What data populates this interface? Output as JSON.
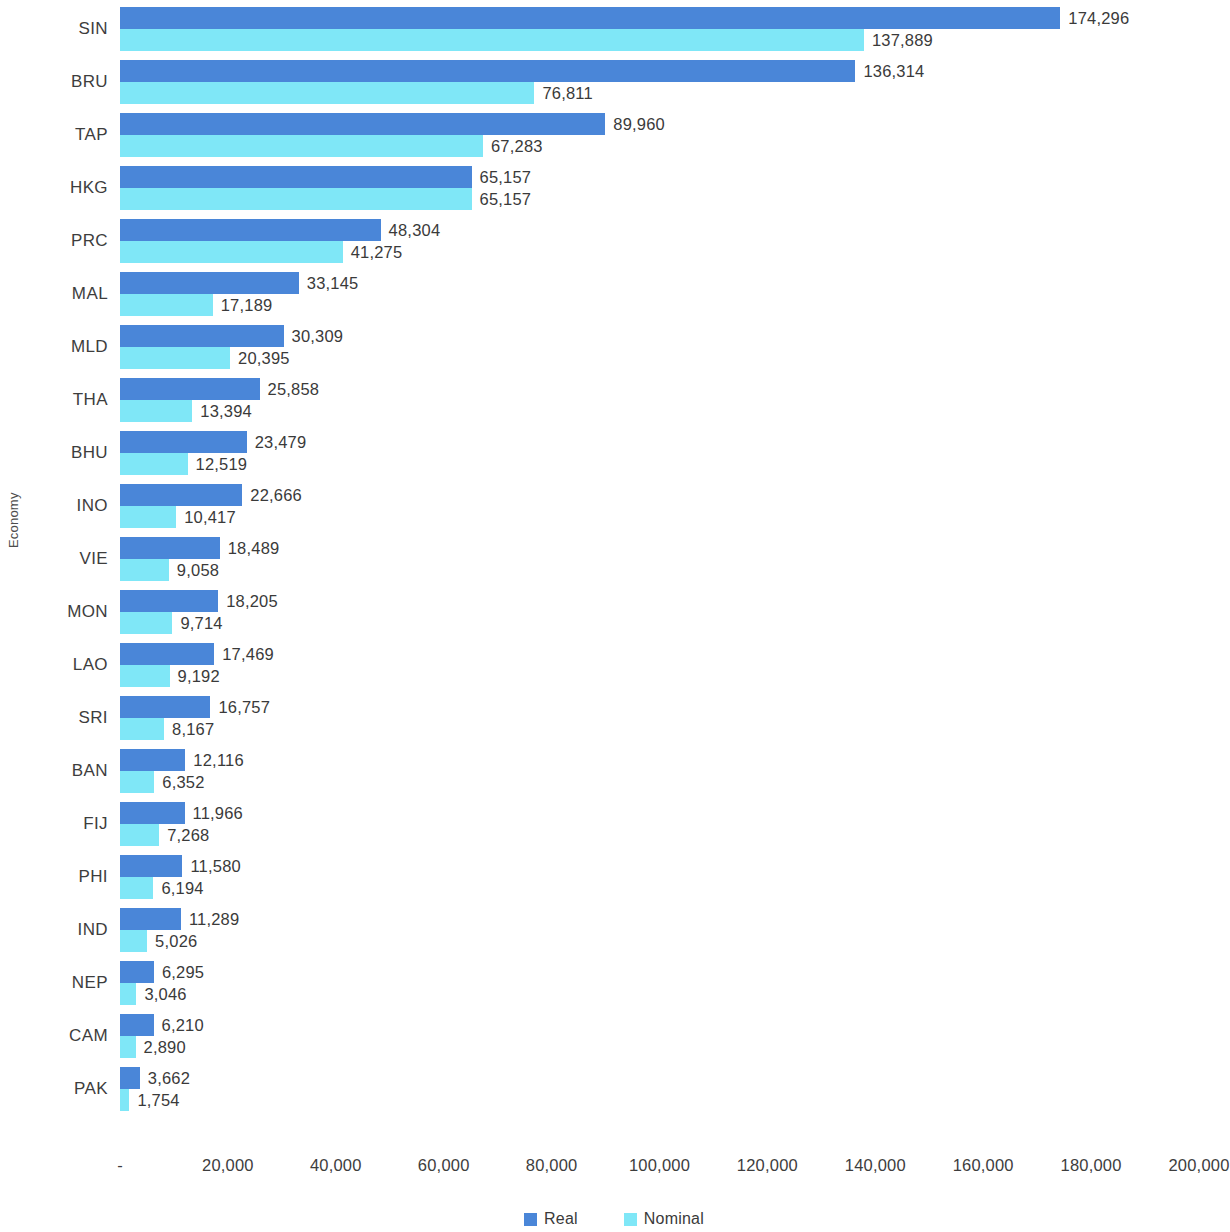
{
  "chart_data": {
    "type": "bar",
    "orientation": "horizontal",
    "title": "",
    "xlabel": "",
    "ylabel": "Economy",
    "xlim": [
      0,
      200000
    ],
    "xtick_labels": [
      "-",
      "20,000",
      "40,000",
      "60,000",
      "80,000",
      "100,000",
      "120,000",
      "140,000",
      "160,000",
      "180,000",
      "200,000"
    ],
    "xtick_values": [
      0,
      20000,
      40000,
      60000,
      80000,
      100000,
      120000,
      140000,
      160000,
      180000,
      200000
    ],
    "grid": false,
    "legend_position": "bottom",
    "categories": [
      "SIN",
      "BRU",
      "TAP",
      "HKG",
      "PRC",
      "MAL",
      "MLD",
      "THA",
      "BHU",
      "INO",
      "VIE",
      "MON",
      "LAO",
      "SRI",
      "BAN",
      "FIJ",
      "PHI",
      "IND",
      "NEP",
      "CAM",
      "PAK"
    ],
    "series": [
      {
        "name": "Real",
        "color": "#4a86d8",
        "values": [
          174296,
          136314,
          89960,
          65157,
          48304,
          33145,
          30309,
          25858,
          23479,
          22666,
          18489,
          18205,
          17469,
          16757,
          12116,
          11966,
          11580,
          11289,
          6295,
          6210,
          3662
        ],
        "labels": [
          "174,296",
          "136,314",
          "89,960",
          "65,157",
          "48,304",
          "33,145",
          "30,309",
          "25,858",
          "23,479",
          "22,666",
          "18,489",
          "18,205",
          "17,469",
          "16,757",
          "12,116",
          "11,966",
          "11,580",
          "11,289",
          "6,295",
          "6,210",
          "3,662"
        ]
      },
      {
        "name": "Nominal",
        "color": "#7fe7f7",
        "values": [
          137889,
          76811,
          67283,
          65157,
          41275,
          17189,
          20395,
          13394,
          12519,
          10417,
          9058,
          9714,
          9192,
          8167,
          6352,
          7268,
          6194,
          5026,
          3046,
          2890,
          1754
        ],
        "labels": [
          "137,889",
          "76,811",
          "67,283",
          "65,157",
          "41,275",
          "17,189",
          "20,395",
          "13,394",
          "12,519",
          "10,417",
          "9,058",
          "9,714",
          "9,192",
          "8,167",
          "6,352",
          "7,268",
          "6,194",
          "5,026",
          "3,046",
          "2,890",
          "1,754"
        ]
      }
    ]
  },
  "legend": {
    "items": [
      {
        "label": "Real",
        "color": "#4a86d8"
      },
      {
        "label": "Nominal",
        "color": "#7fe7f7"
      }
    ]
  }
}
